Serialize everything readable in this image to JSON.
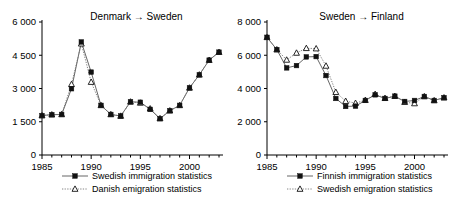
{
  "figure": {
    "panel_count": 2
  },
  "chart_data": [
    {
      "type": "line",
      "title": "Denmark → Sweden",
      "xlabel": "",
      "ylabel": "",
      "xlim": [
        1985,
        2003
      ],
      "ylim": [
        0,
        6000
      ],
      "yticks": [
        0,
        1500,
        3000,
        4500,
        6000
      ],
      "ytick_labels": [
        "0",
        "1 500",
        "3 000",
        "4 500",
        "6 000"
      ],
      "xticks": [
        1985,
        1990,
        1995,
        2000
      ],
      "xtick_labels": [
        "1985",
        "1990",
        "1995",
        "2000"
      ],
      "x": [
        1985,
        1986,
        1987,
        1988,
        1989,
        1990,
        1991,
        1992,
        1993,
        1994,
        1995,
        1996,
        1997,
        1998,
        1999,
        2000,
        2001,
        2002,
        2003
      ],
      "grid": false,
      "legend_position": "below",
      "series": [
        {
          "name": "Swedish immigration statistics",
          "marker": "filled-square",
          "line": "solid",
          "values": [
            1780,
            1820,
            1830,
            2990,
            5100,
            3740,
            2240,
            1830,
            1760,
            2400,
            2380,
            2060,
            1640,
            2000,
            2240,
            3030,
            3620,
            4280,
            4640
          ]
        },
        {
          "name": "Danish emigration statistics",
          "marker": "open-triangle",
          "line": "dotted",
          "values": [
            1780,
            1820,
            1830,
            3190,
            5020,
            3290,
            2240,
            1830,
            1760,
            2400,
            2350,
            2090,
            1650,
            2000,
            2240,
            3030,
            3620,
            4280,
            4640
          ]
        }
      ]
    },
    {
      "type": "line",
      "title": "Sweden → Finland",
      "xlabel": "",
      "ylabel": "",
      "xlim": [
        1985,
        2003
      ],
      "ylim": [
        0,
        8000
      ],
      "yticks": [
        0,
        2000,
        4000,
        6000,
        8000
      ],
      "ytick_labels": [
        "0",
        "2 000",
        "4 000",
        "6 000",
        "8 000"
      ],
      "xticks": [
        1985,
        1990,
        1995,
        2000
      ],
      "xtick_labels": [
        "1985",
        "1990",
        "1995",
        "2000"
      ],
      "x": [
        1985,
        1986,
        1987,
        1988,
        1989,
        1990,
        1991,
        1992,
        1993,
        1994,
        1995,
        1996,
        1997,
        1998,
        1999,
        2000,
        2001,
        2002,
        2003
      ],
      "grid": false,
      "legend_position": "below",
      "series": [
        {
          "name": "Finnish immigration statistics",
          "marker": "filled-square",
          "line": "solid",
          "values": [
            7080,
            6340,
            5240,
            5380,
            5900,
            5920,
            4780,
            3400,
            2920,
            2940,
            3280,
            3620,
            3400,
            3540,
            3220,
            3280,
            3520,
            3280,
            3450
          ]
        },
        {
          "name": "Swedish emigration statistics",
          "marker": "open-triangle",
          "line": "dotted",
          "values": [
            7080,
            6340,
            5720,
            6140,
            6420,
            6400,
            5360,
            3780,
            3240,
            3120,
            3300,
            3660,
            3420,
            3540,
            3180,
            3100,
            3520,
            3280,
            3450
          ]
        }
      ]
    }
  ]
}
